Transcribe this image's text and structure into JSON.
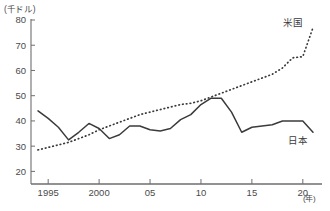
{
  "chart_data": {
    "type": "line",
    "title": "",
    "xlabel": "(年)",
    "ylabel": "(千ドル)",
    "y_unit_label": "(千ドル)",
    "x_unit_label": "(年)",
    "xlim": [
      1994,
      2021
    ],
    "ylim": [
      15,
      80
    ],
    "y_ticks": [
      20,
      30,
      40,
      50,
      60,
      70,
      80
    ],
    "y_tick_labels": [
      "20",
      "30",
      "40",
      "50",
      "60",
      "70",
      "80"
    ],
    "x_ticks": [
      1995,
      2000,
      2005,
      2010,
      2015,
      2020
    ],
    "x_tick_labels": [
      "1995",
      "2000",
      "05",
      "10",
      "15",
      "20"
    ],
    "grid": false,
    "legend_position": "inline-right",
    "x": [
      1994,
      1995,
      1996,
      1997,
      1998,
      1999,
      2000,
      2001,
      2002,
      2003,
      2004,
      2005,
      2006,
      2007,
      2008,
      2009,
      2010,
      2011,
      2012,
      2013,
      2014,
      2015,
      2016,
      2017,
      2018,
      2019,
      2020,
      2021
    ],
    "series": [
      {
        "name": "米国",
        "style": "dotted",
        "color": "#3b3b3b",
        "values": [
          28.5,
          29.5,
          30.5,
          31.5,
          33.0,
          34.5,
          36.5,
          38.0,
          39.5,
          41.0,
          42.5,
          43.5,
          44.5,
          45.5,
          46.5,
          47.0,
          48.0,
          49.5,
          51.0,
          52.5,
          54.0,
          55.5,
          57.0,
          58.5,
          61.0,
          65.0,
          65.5,
          77.0
        ]
      },
      {
        "name": "日本",
        "style": "solid",
        "color": "#3b3b3b",
        "values": [
          44.0,
          41.0,
          37.5,
          32.5,
          35.5,
          39.0,
          37.0,
          33.0,
          34.5,
          38.0,
          38.0,
          36.5,
          36.0,
          37.0,
          40.5,
          42.5,
          46.5,
          49.0,
          49.0,
          43.5,
          35.5,
          37.5,
          38.0,
          38.5,
          40.0,
          40.0,
          40.0,
          35.5
        ]
      }
    ],
    "annotations": [
      {
        "text": "米国",
        "series": "米国"
      },
      {
        "text": "日本",
        "series": "日本"
      }
    ]
  },
  "axes": {
    "y_unit": "(千ドル)",
    "x_unit": "(年)"
  },
  "colors": {
    "axis": "#6e6e6e",
    "line": "#3b3b3b",
    "text": "#4a4a4a",
    "background": "#ffffff"
  }
}
